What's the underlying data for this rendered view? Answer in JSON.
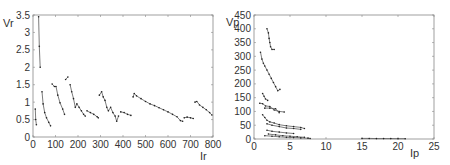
{
  "chart_data": [
    {
      "type": "scatter",
      "title": "",
      "xlabel": "Ir",
      "ylabel": "Vr",
      "xlim": [
        0,
        800
      ],
      "ylim": [
        0,
        3.5
      ],
      "xticks": [
        0,
        100,
        200,
        300,
        400,
        500,
        600,
        700,
        800
      ],
      "yticks": [
        0,
        0.5,
        1,
        1.5,
        2,
        2.5,
        3,
        3.5
      ],
      "xtick_labels": [
        "0",
        "100",
        "200",
        "300",
        "400",
        "500",
        "600",
        "700",
        "800"
      ],
      "ytick_labels": [
        "0",
        "0.5",
        "1",
        "1.5",
        "2",
        "2.5",
        "3",
        "3.5"
      ],
      "grid": false,
      "legend": "none",
      "series": [
        {
          "name": "s1",
          "x": [
            10,
            12,
            15
          ],
          "y": [
            0.8,
            0.5,
            0.35
          ]
        },
        {
          "name": "s2",
          "x": [
            25,
            28,
            32
          ],
          "y": [
            3.45,
            2.6,
            2.0
          ]
        },
        {
          "name": "s3",
          "x": [
            40,
            45,
            52,
            60,
            70,
            78
          ],
          "y": [
            1.3,
            0.95,
            0.7,
            0.55,
            0.42,
            0.32
          ]
        },
        {
          "name": "s4",
          "x": [
            85,
            95,
            102,
            110,
            120,
            132,
            140
          ],
          "y": [
            1.52,
            1.45,
            1.45,
            1.2,
            0.98,
            0.8,
            0.65
          ]
        },
        {
          "name": "s5",
          "x": [
            145,
            155
          ],
          "y": [
            1.65,
            1.72
          ]
        },
        {
          "name": "s6",
          "x": [
            165,
            172,
            180,
            188,
            195,
            205,
            215,
            225,
            232
          ],
          "y": [
            1.5,
            1.3,
            1.1,
            0.85,
            0.95,
            0.85,
            0.75,
            0.65,
            0.6
          ]
        },
        {
          "name": "s7",
          "x": [
            240,
            255,
            270,
            285,
            290
          ],
          "y": [
            0.75,
            0.7,
            0.65,
            0.58,
            0.55
          ]
        },
        {
          "name": "s8",
          "x": [
            295,
            305,
            312,
            320,
            328,
            335,
            345,
            355,
            365,
            372,
            380
          ],
          "y": [
            1.2,
            1.3,
            1.15,
            1.05,
            0.85,
            0.75,
            0.85,
            0.7,
            0.6,
            0.45,
            0.6
          ]
        },
        {
          "name": "s9",
          "x": [
            390,
            405,
            420,
            435
          ],
          "y": [
            0.72,
            0.7,
            0.65,
            0.62
          ]
        },
        {
          "name": "s10",
          "x": [
            445,
            450,
            460,
            480,
            500,
            520,
            540,
            560,
            580,
            600,
            620,
            640,
            655,
            665
          ],
          "y": [
            1.15,
            1.25,
            1.18,
            1.1,
            1.02,
            0.95,
            0.9,
            0.84,
            0.78,
            0.72,
            0.65,
            0.58,
            0.47,
            0.45
          ]
        },
        {
          "name": "s11",
          "x": [
            672,
            685,
            700,
            712
          ],
          "y": [
            0.55,
            0.57,
            0.55,
            0.53
          ]
        },
        {
          "name": "s12",
          "x": [
            720,
            728,
            740,
            755,
            770,
            785,
            795
          ],
          "y": [
            1.0,
            1.02,
            0.92,
            0.85,
            0.78,
            0.7,
            0.63
          ]
        }
      ]
    },
    {
      "type": "scatter",
      "title": "",
      "xlabel": "Ip",
      "ylabel": "Vp",
      "xlim": [
        0,
        25
      ],
      "ylim": [
        0,
        450
      ],
      "xticks": [
        0,
        5,
        10,
        15,
        20,
        25
      ],
      "yticks": [
        0,
        50,
        100,
        150,
        200,
        250,
        300,
        350,
        400,
        450
      ],
      "xtick_labels": [
        "0",
        "5",
        "10",
        "15",
        "20",
        "25"
      ],
      "ytick_labels": [
        "0",
        "50",
        "100",
        "150",
        "200",
        "250",
        "300",
        "350",
        "400",
        "450"
      ],
      "grid": false,
      "legend": "none",
      "series": [
        {
          "name": "s1",
          "x": [
            1.8,
            2.0,
            2.1,
            2.2,
            2.3,
            2.5,
            2.8
          ],
          "y": [
            400,
            385,
            365,
            350,
            335,
            325,
            325
          ]
        },
        {
          "name": "s2",
          "x": [
            0.9,
            1.1,
            1.3,
            1.5,
            1.8,
            2.1,
            2.4,
            2.7,
            3.0,
            3.3,
            3.6
          ],
          "y": [
            315,
            290,
            275,
            265,
            250,
            235,
            220,
            205,
            190,
            175,
            180
          ]
        },
        {
          "name": "s3",
          "x": [
            1.2,
            1.4,
            1.6,
            1.9
          ],
          "y": [
            165,
            155,
            145,
            140
          ]
        },
        {
          "name": "s4",
          "x": [
            0.8,
            1.2,
            1.6,
            2.2,
            2.8,
            3.5,
            4.2
          ],
          "y": [
            130,
            128,
            120,
            118,
            105,
            100,
            98
          ]
        },
        {
          "name": "s5",
          "x": [
            1.5,
            2.2,
            3.0,
            3.5
          ],
          "y": [
            112,
            112,
            110,
            95
          ]
        },
        {
          "name": "s6",
          "x": [
            1.2,
            1.5,
            1.8,
            2.2,
            2.8,
            3.5,
            4.5,
            5.5,
            6.5,
            7.0
          ],
          "y": [
            88,
            78,
            68,
            62,
            58,
            52,
            48,
            45,
            42,
            38
          ]
        },
        {
          "name": "s7",
          "x": [
            1.8,
            2.5,
            3.5,
            4.5,
            5.5,
            6.5
          ],
          "y": [
            55,
            50,
            45,
            40,
            38,
            35
          ]
        },
        {
          "name": "s8",
          "x": [
            1.8,
            2.5,
            3.5,
            4.5,
            5.5
          ],
          "y": [
            32,
            28,
            25,
            22,
            20
          ]
        },
        {
          "name": "s9",
          "x": [
            2.0,
            3.0,
            4.0,
            5.0,
            6.0,
            7.0
          ],
          "y": [
            18,
            15,
            12,
            10,
            8,
            6
          ]
        },
        {
          "name": "s10",
          "x": [
            1.5,
            2.5,
            3.5,
            4.5,
            5.5,
            6.5,
            7.5,
            7.8
          ],
          "y": [
            12,
            10,
            8,
            6,
            5,
            4,
            3,
            2
          ]
        },
        {
          "name": "s11",
          "x": [
            15.0,
            16.0,
            17.0,
            18.0,
            19.0,
            20.0,
            21.0
          ],
          "y": [
            2,
            2,
            1.5,
            1.5,
            1.5,
            1,
            1
          ]
        }
      ]
    }
  ],
  "plots": {
    "left": {
      "ylabel": "Vr",
      "xlabel": "Ir"
    },
    "right": {
      "ylabel": "Vp",
      "xlabel": "Ip"
    }
  }
}
